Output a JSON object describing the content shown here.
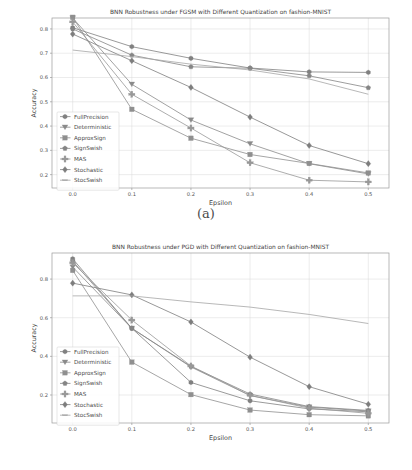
{
  "figure": {
    "subcaption_a": "(a)",
    "subcaption_b": "(b)"
  },
  "chart_data": [
    {
      "id": "a",
      "type": "line",
      "title": "BNN Robustness under FGSM with Different Quantization on fashion-MNIST",
      "xlabel": "Epsilon",
      "ylabel": "Accuracy",
      "x": [
        0.0,
        0.1,
        0.2,
        0.3,
        0.4,
        0.5
      ],
      "xticks": [
        "0.0",
        "0.1",
        "0.2",
        "0.3",
        "0.4",
        "0.5"
      ],
      "yticks": [
        "0.2",
        "0.3",
        "0.4",
        "0.5",
        "0.6",
        "0.7",
        "0.8"
      ],
      "xlim": [
        -0.035,
        0.535
      ],
      "ylim": [
        0.145,
        0.845
      ],
      "grid": true,
      "legend_position": "lower left",
      "series": [
        {
          "name": "FullPrecision",
          "marker": "hexagon",
          "color": "#808080",
          "values": [
            0.805,
            0.727,
            0.679,
            0.639,
            0.623,
            0.621
          ]
        },
        {
          "name": "Deterministic",
          "marker": "triangle-down",
          "color": "#8a8a8a",
          "values": [
            0.845,
            0.572,
            0.425,
            0.327,
            0.245,
            0.203
          ]
        },
        {
          "name": "ApproxSign",
          "marker": "square",
          "color": "#8f8f8f",
          "values": [
            0.848,
            0.469,
            0.35,
            0.283,
            0.246,
            0.207
          ]
        },
        {
          "name": "SignSwish",
          "marker": "pentagon",
          "color": "#858585",
          "values": [
            0.8,
            0.692,
            0.644,
            0.638,
            0.607,
            0.558
          ]
        },
        {
          "name": "MAS",
          "marker": "plus",
          "color": "#989898",
          "values": [
            0.829,
            0.531,
            0.392,
            0.249,
            0.177,
            0.17
          ]
        },
        {
          "name": "Stochastic",
          "marker": "diamond",
          "color": "#7d7d7d",
          "values": [
            0.779,
            0.669,
            0.559,
            0.437,
            0.32,
            0.245
          ]
        },
        {
          "name": "StocSwish",
          "marker": "line",
          "color": "#a6a6a6",
          "values": [
            0.713,
            0.686,
            0.655,
            0.631,
            0.594,
            0.531
          ]
        }
      ]
    },
    {
      "id": "b",
      "type": "line",
      "title": "BNN Robustness under PGD with Different Quantization on fashion-MNIST",
      "xlabel": "Epsilon",
      "ylabel": "Accuracy",
      "x": [
        0.0,
        0.1,
        0.2,
        0.3,
        0.4,
        0.5
      ],
      "xticks": [
        "0.0",
        "0.1",
        "0.2",
        "0.3",
        "0.4",
        "0.5"
      ],
      "yticks": [
        "0.2",
        "0.4",
        "0.6",
        "0.8"
      ],
      "xlim": [
        -0.035,
        0.535
      ],
      "ylim": [
        0.055,
        0.935
      ],
      "grid": true,
      "legend_position": "lower left",
      "series": [
        {
          "name": "FullPrecision",
          "marker": "hexagon",
          "color": "#808080",
          "values": [
            0.905,
            0.545,
            0.265,
            0.17,
            0.128,
            0.113
          ]
        },
        {
          "name": "Deterministic",
          "marker": "triangle-down",
          "color": "#8a8a8a",
          "values": [
            0.862,
            0.545,
            0.345,
            0.197,
            0.137,
            0.117
          ]
        },
        {
          "name": "ApproxSign",
          "marker": "square",
          "color": "#8f8f8f",
          "values": [
            0.845,
            0.37,
            0.202,
            0.122,
            0.098,
            0.092
          ]
        },
        {
          "name": "SignSwish",
          "marker": "pentagon",
          "color": "#858585",
          "values": [
            0.893,
            0.545,
            0.348,
            0.205,
            0.14,
            0.12
          ]
        },
        {
          "name": "MAS",
          "marker": "plus",
          "color": "#989898",
          "values": [
            0.884,
            0.588,
            0.35,
            0.198,
            0.132,
            0.105
          ]
        },
        {
          "name": "Stochastic",
          "marker": "diamond",
          "color": "#7d7d7d",
          "values": [
            0.779,
            0.718,
            0.578,
            0.396,
            0.243,
            0.152
          ]
        },
        {
          "name": "StocSwish",
          "marker": "line",
          "color": "#a6a6a6",
          "values": [
            0.713,
            0.713,
            0.682,
            0.655,
            0.617,
            0.57
          ]
        }
      ]
    }
  ]
}
